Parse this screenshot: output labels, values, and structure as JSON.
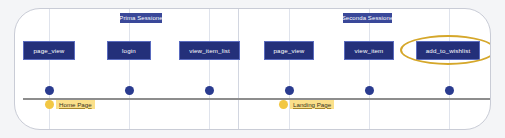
{
  "diagram": {
    "colors": {
      "box_fill": "#24307a",
      "box_border": "#5a6bbf",
      "node": "#2a3b8f",
      "axis": "#8d8d8d",
      "grid": "#dfe3ec",
      "highlight": "#d5a72a",
      "legend_dot": "#f2c744",
      "legend_pill": "#fbe08a",
      "card_border": "#c9ccd6",
      "canvas": "#f4f5f7"
    },
    "sessions": [
      {
        "label": "Prima Sessione",
        "left": 119,
        "width": 42
      },
      {
        "label": "Seconda Sessione",
        "left": 342,
        "width": 49
      }
    ],
    "divider": {
      "x": 237
    },
    "gridlines": [
      48,
      128,
      208,
      288,
      368,
      448
    ],
    "events": [
      {
        "label": "page_view",
        "left": 22,
        "width": 52,
        "x": 48,
        "session": "Prima Sessione"
      },
      {
        "label": "login",
        "left": 106,
        "width": 44,
        "x": 128,
        "session": "Prima Sessione"
      },
      {
        "label": "view_item_list",
        "left": 178,
        "width": 61,
        "x": 208,
        "session": "Prima Sessione"
      },
      {
        "label": "page_view",
        "left": 263,
        "width": 50,
        "x": 288,
        "session": "Seconda Sessione"
      },
      {
        "label": "view_item",
        "left": 343,
        "width": 50,
        "x": 368,
        "session": "Seconda Sessione"
      },
      {
        "label": "add_to_wishlist",
        "left": 415,
        "width": 64,
        "x": 448,
        "session": "Seconda Sessione",
        "highlighted": true
      }
    ],
    "nodes": [
      48,
      128,
      208,
      288,
      368,
      448
    ],
    "legend": [
      {
        "label": "Home Page",
        "left": 44,
        "x": 48
      },
      {
        "label": "Landing Page",
        "left": 278,
        "x": 288
      }
    ]
  }
}
